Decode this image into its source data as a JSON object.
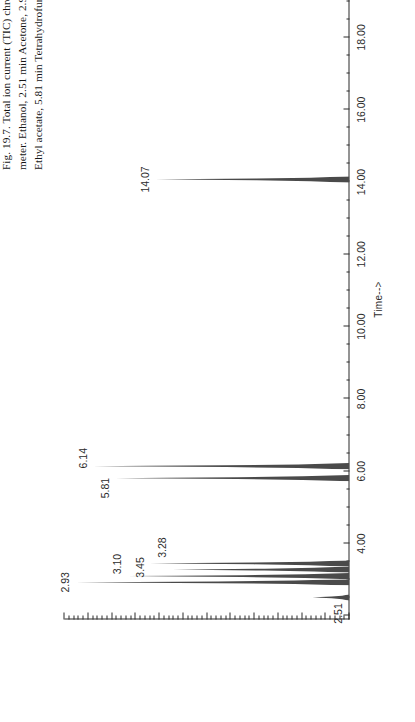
{
  "figure": {
    "number": "19.7",
    "top_bleed_text": "",
    "caption_lines": [
      "Fig. 19.7.  Total  ion  current  (TIC)  chromatogram  of  a  residual  solvent  mixture,  detected  by  the  mass  spectro-",
      "meter. Ethanol, 2.51 min Acetone, 2.93 min Isopropanol, 3.10 min Acetonitrile, 3.28 min Dichloromethane, 3.45 min",
      "Ethyl acetate, 5.81 min Tetrahydrofuran, 6.14 min Toluene, 14.07 min."
    ],
    "caption_full": "Fig. 19.7. Total ion current (TIC) chromatogram of a residual solvent mixture, detected by the mass spectrometer. Ethanol, 2.51 min Acetone, 2.93 min Isopropanol, 3.10 min Acetonitrile, 3.28 min Dichloromethane, 3.45 min Ethyl acetate, 5.81 min Tetrahydrofuran, 6.14 min Toluene, 14.07 min."
  },
  "chart_data": {
    "type": "line",
    "title": "",
    "xlabel": "Time-->",
    "ylabel": "",
    "xlim": [
      1.9,
      19.6
    ],
    "ylim": [
      0,
      100
    ],
    "grid": false,
    "legend": "none",
    "orientation": "rotated-90-ccw",
    "x_tick_labels": [
      "4.00",
      "6.00",
      "8.00",
      "10.00",
      "12.00",
      "14.00",
      "16.00",
      "18.00"
    ],
    "x_tick_values": [
      4,
      6,
      8,
      10,
      12,
      14,
      16,
      18
    ],
    "x_minor_tick_step": 0.5,
    "peaks": [
      {
        "label": "2.51",
        "rt": 2.51,
        "height": 13,
        "compound": "Ethanol"
      },
      {
        "label": "2.93",
        "rt": 2.93,
        "height": 96,
        "compound": "Acetone"
      },
      {
        "label": "3.10",
        "rt": 3.1,
        "height": 78,
        "compound": "Isopropanol"
      },
      {
        "label": "3.28",
        "rt": 3.28,
        "height": 62,
        "compound": "Acetonitrile"
      },
      {
        "label": "3.45",
        "rt": 3.45,
        "height": 70,
        "compound": "Dichloromethane"
      },
      {
        "label": "5.81",
        "rt": 5.81,
        "height": 82,
        "compound": "Ethyl acetate"
      },
      {
        "label": "6.14",
        "rt": 6.14,
        "height": 90,
        "compound": "Tetrahydrofuran"
      },
      {
        "label": "14.07",
        "rt": 14.07,
        "height": 68,
        "compound": "Toluene"
      }
    ],
    "compounds": [
      {
        "name": "Ethanol",
        "rt_min": "2.51"
      },
      {
        "name": "Acetone",
        "rt_min": "2.93"
      },
      {
        "name": "Isopropanol",
        "rt_min": "3.10"
      },
      {
        "name": "Acetonitrile",
        "rt_min": "3.28"
      },
      {
        "name": "Dichloromethane",
        "rt_min": "3.45"
      },
      {
        "name": "Ethyl acetate",
        "rt_min": "5.81"
      },
      {
        "name": "Tetrahydrofuran",
        "rt_min": "6.14"
      },
      {
        "name": "Toluene",
        "rt_min": "14.07"
      }
    ]
  },
  "colors": {
    "ink": "#1b1b1b",
    "axis": "#2b2b2b",
    "trace": "#4a4a4a",
    "paper": "#ffffff"
  }
}
